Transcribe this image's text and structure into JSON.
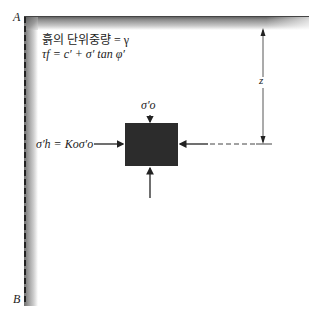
{
  "diagram": {
    "corner_labels": {
      "top": "A",
      "bottom": "B"
    },
    "properties": {
      "unit_weight_line": "흙의 단위중량 = γ",
      "shear_strength_line": "τf = c′ + σ′ tan φ′"
    },
    "vertical_stress_label": "σ′o",
    "horizontal_stress_label": "σ′h = Koσ′o",
    "depth_label": "z",
    "colors": {
      "wall_dark": "#555555",
      "block": "#2c2c2c",
      "lines": "#222222"
    }
  }
}
